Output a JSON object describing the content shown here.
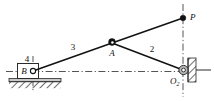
{
  "diagram": {
    "background_color": "#ffffff",
    "line_color": "#121212",
    "hatch_color": "#5a5a5a",
    "fill_color": "#d8d8d8",
    "labels": {
      "link_ground": "4",
      "link_coupler": "3",
      "link_crank": "2",
      "joint_b": "B",
      "joint_a": "A",
      "point_p": "P",
      "pivot_o2": "O",
      "pivot_o2_subscript": "2"
    },
    "nodes": [
      {
        "name": "B",
        "x": 33,
        "y": 71,
        "type": "slider-pin"
      },
      {
        "name": "A",
        "x": 112,
        "y": 43,
        "type": "pin-joint"
      },
      {
        "name": "P",
        "x": 183,
        "y": 18,
        "type": "point-mass"
      },
      {
        "name": "O2",
        "x": 183,
        "y": 70,
        "type": "ground-pivot"
      }
    ],
    "links": [
      {
        "name": "3",
        "from": "B",
        "to": "A"
      },
      {
        "name": "2",
        "from": "A",
        "to": "O2"
      },
      {
        "name": "AP",
        "from": "A",
        "to": "P"
      }
    ],
    "centerlines": [
      {
        "name": "horizontal-centerline",
        "x1": 8,
        "y1": 71,
        "x2": 190,
        "y2": 71
      },
      {
        "name": "vertical-centerline",
        "x1": 183,
        "y1": 5,
        "x2": 183,
        "y2": 96
      }
    ]
  }
}
